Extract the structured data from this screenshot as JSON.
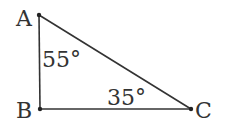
{
  "diagram": {
    "type": "right-triangle",
    "vertices": {
      "A": {
        "label": "A",
        "x": 39,
        "y": 15
      },
      "B": {
        "label": "B",
        "x": 40,
        "y": 109
      },
      "C": {
        "label": "C",
        "x": 191,
        "y": 109
      }
    },
    "angles": {
      "A": "55°",
      "C": "35°"
    },
    "stroke_color": "#333333"
  }
}
